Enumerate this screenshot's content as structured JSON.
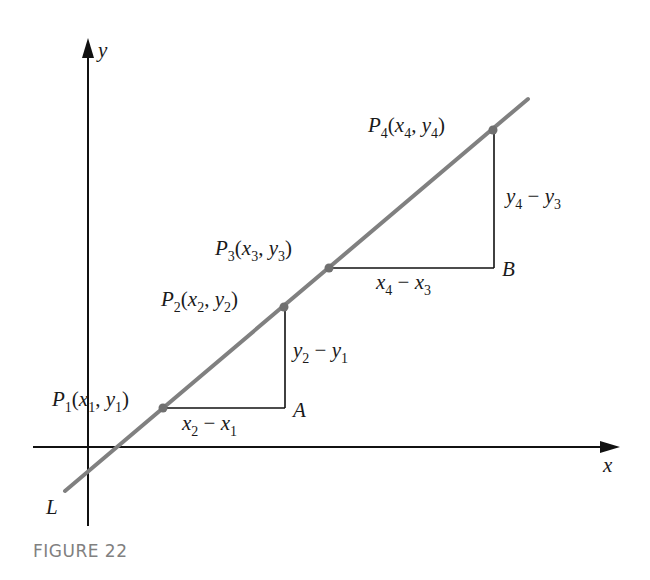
{
  "figure": {
    "caption": "FIGURE 22",
    "axes": {
      "x_label": "x",
      "y_label": "y"
    },
    "line": {
      "label": "L",
      "color": "#808080"
    },
    "points": [
      {
        "name": "P",
        "index": "1",
        "x_sym": "x",
        "y_sym": "y",
        "label": "P1(x1, y1)"
      },
      {
        "name": "P",
        "index": "2",
        "x_sym": "x",
        "y_sym": "y",
        "label": "P2(x2, y2)"
      },
      {
        "name": "P",
        "index": "3",
        "x_sym": "x",
        "y_sym": "y",
        "label": "P3(x3, y3)"
      },
      {
        "name": "P",
        "index": "4",
        "x_sym": "x",
        "y_sym": "y",
        "label": "P4(x4, y4)"
      }
    ],
    "corners": [
      {
        "label": "A"
      },
      {
        "label": "B"
      }
    ],
    "differences": {
      "run1": {
        "a": "x",
        "a_idx": "2",
        "op": "−",
        "b": "x",
        "b_idx": "1",
        "label": "x2 − x1"
      },
      "rise1": {
        "a": "y",
        "a_idx": "2",
        "op": "−",
        "b": "y",
        "b_idx": "1",
        "label": "y2 − y1"
      },
      "run2": {
        "a": "x",
        "a_idx": "4",
        "op": "−",
        "b": "x",
        "b_idx": "3",
        "label": "x4 − x3"
      },
      "rise2": {
        "a": "y",
        "a_idx": "4",
        "op": "−",
        "b": "y",
        "b_idx": "3",
        "label": "y4 − y3"
      }
    },
    "colors": {
      "axis": "#111111",
      "line": "#808080",
      "point": "#707070",
      "caption": "#808080"
    }
  }
}
